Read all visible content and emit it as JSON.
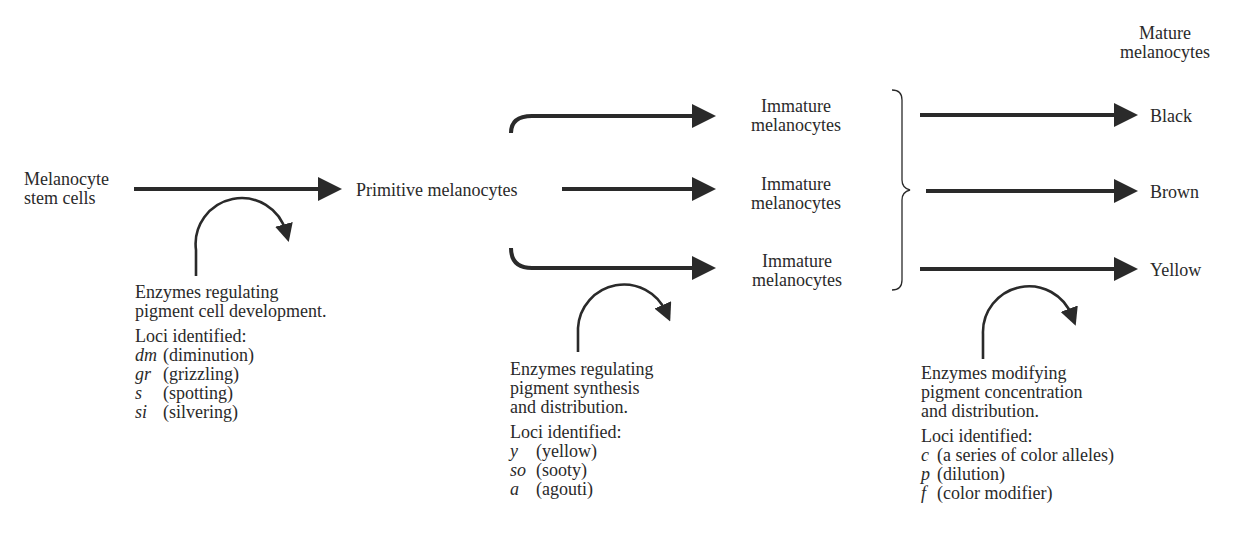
{
  "diagram": {
    "type": "flowchart",
    "nodes": {
      "stem": {
        "line1": "Melanocyte",
        "line2": "stem cells"
      },
      "primitive": {
        "label": "Primitive melanocytes"
      },
      "immature": [
        {
          "line1": "Immature",
          "line2": "melanocytes"
        },
        {
          "line1": "Immature",
          "line2": "melanocytes"
        },
        {
          "line1": "Immature",
          "line2": "melanocytes"
        }
      ],
      "mature_header": {
        "line1": "Mature",
        "line2": "melanocytes"
      },
      "mature": [
        {
          "label": "Black"
        },
        {
          "label": "Brown"
        },
        {
          "label": "Yellow"
        }
      ]
    },
    "edges": [
      {
        "from": "Melanocyte stem cells",
        "to": "Primitive melanocytes"
      },
      {
        "from": "Primitive melanocytes",
        "to": "Immature melanocytes (1)"
      },
      {
        "from": "Primitive melanocytes",
        "to": "Immature melanocytes (2)"
      },
      {
        "from": "Primitive melanocytes",
        "to": "Immature melanocytes (3)"
      },
      {
        "from": "Immature melanocytes (bracket)",
        "to": "Black"
      },
      {
        "from": "Immature melanocytes (bracket)",
        "to": "Brown"
      },
      {
        "from": "Immature melanocytes (bracket)",
        "to": "Yellow"
      }
    ],
    "annotations": [
      {
        "desc_lines": [
          "Enzymes regulating",
          "pigment cell development."
        ],
        "loci_header": "Loci identified:",
        "loci": [
          {
            "symbol": "dm",
            "name": "(diminution)"
          },
          {
            "symbol": "gr",
            "name": "(grizzling)"
          },
          {
            "symbol": "s",
            "name": "(spotting)"
          },
          {
            "symbol": "si",
            "name": "(silvering)"
          }
        ]
      },
      {
        "desc_lines": [
          "Enzymes regulating",
          "pigment synthesis",
          "and distribution."
        ],
        "loci_header": "Loci identified:",
        "loci": [
          {
            "symbol": "y",
            "name": "(yellow)"
          },
          {
            "symbol": "so",
            "name": "(sooty)"
          },
          {
            "symbol": "a",
            "name": "(agouti)"
          }
        ]
      },
      {
        "desc_lines": [
          "Enzymes modifying",
          "pigment concentration",
          "and distribution."
        ],
        "loci_header": "Loci identified:",
        "loci": [
          {
            "symbol": "c",
            "name": "(a series of color alleles)"
          },
          {
            "symbol": "p",
            "name": "(dilution)"
          },
          {
            "symbol": "f",
            "name": "(color modifier)"
          }
        ]
      }
    ]
  },
  "colors": {
    "ink": "#2a2a2a",
    "background": "#ffffff"
  }
}
